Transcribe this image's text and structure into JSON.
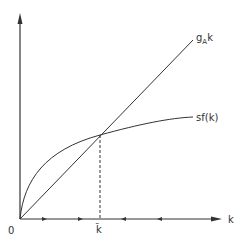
{
  "diagram": {
    "axes": {
      "origin_label": "0",
      "x_label": "k",
      "y_label": ""
    },
    "curves": [
      {
        "name": "line",
        "label_main": "g",
        "label_sub": "A",
        "label_suffix": "k",
        "type": "straight line through origin"
      },
      {
        "name": "curve",
        "label": "sf(k)",
        "type": "concave curve through origin"
      }
    ],
    "steady_state": {
      "label": "k̃",
      "marker": "dashed vertical line from intersection to k-axis"
    },
    "axis_arrows": {
      "left_of_steady_state": "pointing right",
      "right_of_steady_state": "pointing left"
    },
    "colors": {
      "line": "#333333",
      "background": "#ffffff"
    }
  }
}
